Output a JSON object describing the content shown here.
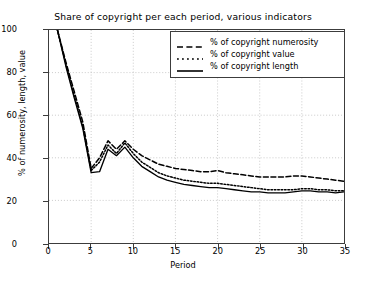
{
  "chart_data": {
    "type": "line",
    "title": "Share of copyright per each period, various indicators",
    "xlabel": "Period",
    "ylabel": "% of numerosity, length, value",
    "xlim": [
      0,
      35
    ],
    "ylim": [
      0,
      100
    ],
    "xticks": [
      0,
      5,
      10,
      15,
      20,
      25,
      30,
      35
    ],
    "yticks": [
      0,
      20,
      40,
      60,
      80,
      100
    ],
    "grid": true,
    "grid_style": "dotted",
    "legend_position": "upper right",
    "x": [
      1,
      2,
      3,
      4,
      5,
      6,
      7,
      8,
      9,
      10,
      11,
      12,
      13,
      14,
      15,
      16,
      17,
      18,
      19,
      20,
      21,
      22,
      23,
      24,
      25,
      26,
      27,
      28,
      29,
      30,
      31,
      32,
      33,
      34,
      35
    ],
    "series": [
      {
        "name": "% of copyright numerosity",
        "style": "dashed",
        "color": "#000000",
        "values": [
          100,
          85,
          71,
          57,
          35,
          40,
          48,
          44,
          48,
          44,
          41,
          39,
          37,
          36,
          35,
          34.5,
          34,
          33.5,
          33.5,
          34,
          33,
          32.5,
          32,
          31.5,
          31,
          31,
          31,
          31,
          31.5,
          31.5,
          31,
          30.5,
          30,
          29.5,
          29
        ]
      },
      {
        "name": "% of copyright value",
        "style": "dotted",
        "color": "#000000",
        "values": [
          100,
          84,
          69,
          55,
          34,
          38,
          46,
          42,
          47,
          42,
          38,
          35.5,
          33,
          31.5,
          30.5,
          29.5,
          29,
          28.5,
          28,
          28,
          27.5,
          27,
          26.5,
          26,
          25.5,
          25,
          25,
          25,
          25,
          25.5,
          25.5,
          25,
          25,
          24.5,
          24.5
        ]
      },
      {
        "name": "% of copyright length",
        "style": "solid",
        "color": "#000000",
        "values": [
          100,
          83,
          68,
          54,
          33,
          33.5,
          44,
          41,
          45,
          40,
          36,
          33.5,
          31,
          29.5,
          28.5,
          27.5,
          27,
          26.5,
          26,
          26,
          25.5,
          25,
          24.5,
          24,
          24,
          23.5,
          23.5,
          23.5,
          24,
          24.5,
          24.5,
          24,
          24,
          23.5,
          24
        ]
      }
    ]
  }
}
